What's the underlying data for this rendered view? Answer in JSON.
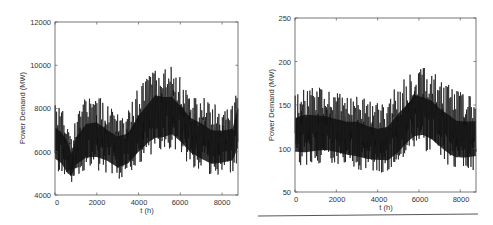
{
  "chart_data": [
    {
      "type": "line",
      "title": "",
      "xlabel": "t (h)",
      "ylabel": "Power Demand (MW)",
      "xlim": [
        0,
        8760
      ],
      "ylim": [
        4000,
        12000
      ],
      "xticks": [
        0,
        2000,
        4000,
        6000,
        8000
      ],
      "yticks": [
        4000,
        6000,
        8000,
        10000,
        12000
      ],
      "grid": false,
      "legend": null,
      "series": [
        {
          "name": "hourly demand",
          "color": "#111111",
          "envelope_x": [
            0,
            300,
            600,
            800,
            1000,
            1500,
            2000,
            2500,
            3000,
            3500,
            4000,
            4500,
            4800,
            5200,
            5600,
            6000,
            6500,
            7000,
            7500,
            8000,
            8500,
            8760
          ],
          "envelope_upper": [
            8400,
            8200,
            7800,
            6800,
            7800,
            8700,
            8800,
            8300,
            8000,
            8100,
            9200,
            9900,
            10400,
            10200,
            10100,
            9600,
            9000,
            8800,
            8400,
            8300,
            8400,
            9800
          ],
          "envelope_lower": [
            5000,
            4800,
            4300,
            4400,
            4800,
            5000,
            5000,
            4900,
            4600,
            4800,
            5200,
            5600,
            5700,
            5800,
            6000,
            5700,
            5200,
            4900,
            4700,
            4800,
            4900,
            5300
          ]
        }
      ]
    },
    {
      "type": "line",
      "title": "",
      "xlabel": "t (h)",
      "ylabel": "Power Demand (MW)",
      "xlim": [
        0,
        8760
      ],
      "ylim": [
        50,
        250
      ],
      "xticks": [
        0,
        2000,
        4000,
        6000,
        8000
      ],
      "yticks": [
        50,
        100,
        150,
        200,
        250
      ],
      "grid": false,
      "legend": null,
      "series": [
        {
          "name": "hourly demand",
          "color": "#111111",
          "envelope_x": [
            0,
            500,
            1000,
            1500,
            2000,
            2500,
            3000,
            3500,
            4000,
            4500,
            5000,
            5500,
            5800,
            6200,
            6600,
            7000,
            7500,
            7800,
            8200,
            8760
          ],
          "envelope_upper": [
            170,
            178,
            175,
            172,
            168,
            165,
            167,
            160,
            155,
            160,
            180,
            192,
            204,
            198,
            195,
            185,
            178,
            170,
            168,
            168
          ],
          "envelope_lower": [
            78,
            75,
            78,
            80,
            78,
            75,
            72,
            70,
            70,
            68,
            75,
            88,
            92,
            95,
            90,
            82,
            72,
            70,
            70,
            72
          ]
        }
      ]
    }
  ],
  "charts": {
    "left": {
      "ylabel": "Power Demand (MW)",
      "xlabel": "t (h)",
      "yticks": [
        "4000",
        "6000",
        "8000",
        "10000",
        "12000"
      ],
      "xticks": [
        "0",
        "2000",
        "4000",
        "6000",
        "8000"
      ]
    },
    "right": {
      "ylabel": "Power Demand (MW)",
      "xlabel": "t (h)",
      "yticks": [
        "50",
        "100",
        "150",
        "200",
        "250"
      ],
      "xticks": [
        "0",
        "2000",
        "4000",
        "6000",
        "8000"
      ]
    }
  }
}
